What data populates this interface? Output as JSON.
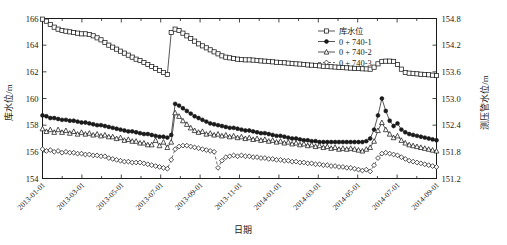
{
  "chart_data": {
    "type": "line",
    "title": "",
    "xlabel": "日期",
    "ylabel": "库水位/m",
    "ylabel_right": "测压管水位/m",
    "grid": false,
    "legend_position": "top-right",
    "ylim": [
      154,
      166
    ],
    "ylim_right": [
      151.2,
      154.8
    ],
    "yticks": [
      "154",
      "156",
      "158",
      "160",
      "162",
      "164",
      "166"
    ],
    "ytick_values": [
      154,
      156,
      158,
      160,
      162,
      164,
      166
    ],
    "yticks_right": [
      "151.2",
      "151.8",
      "152.4",
      "153.0",
      "153.6",
      "154.2",
      "154.8"
    ],
    "ytick_values_right": [
      151.2,
      151.8,
      152.4,
      153.0,
      153.6,
      154.2,
      154.8
    ],
    "xlim": [
      "2013-01-01",
      "2014-09-01"
    ],
    "xticks": [
      "2013-01-01",
      "2013-03-01",
      "2013-05-01",
      "2013-07-01",
      "2013-09-01",
      "2013-11-01",
      "2014-01-01",
      "2014-03-01",
      "2014-05-01",
      "2014-07-01",
      "2014-09-01"
    ],
    "x": [
      0,
      1,
      2,
      3,
      4,
      5,
      6,
      7,
      8,
      9,
      10,
      11,
      12,
      13,
      14,
      15,
      16,
      17,
      18,
      19,
      20,
      21,
      22,
      23,
      24,
      25,
      26,
      27,
      28,
      29,
      30,
      31,
      32,
      33,
      34,
      35,
      36,
      37,
      38,
      39,
      40,
      41,
      42,
      43,
      44,
      45,
      46,
      47,
      48,
      49,
      50,
      51,
      52,
      53,
      54,
      55,
      56,
      57,
      58,
      59,
      60,
      61,
      62,
      63,
      64,
      65,
      66,
      67,
      68,
      69,
      70,
      71,
      72,
      73,
      74,
      75,
      76,
      77,
      78,
      79,
      80,
      81,
      82,
      83,
      84,
      85,
      86,
      87,
      88,
      89,
      90,
      91,
      92,
      93,
      94,
      95,
      96,
      97,
      98,
      99,
      100,
      101
    ],
    "series": [
      {
        "name": "库水位",
        "axis": "left",
        "marker": "open-square",
        "linestyle": "solid",
        "values": [
          165.95,
          165.8,
          165.55,
          165.35,
          165.2,
          165.1,
          165.05,
          165.0,
          164.95,
          164.9,
          164.85,
          164.85,
          164.8,
          164.7,
          164.55,
          164.4,
          164.2,
          164.0,
          163.85,
          163.7,
          163.55,
          163.4,
          163.25,
          163.1,
          162.95,
          162.85,
          162.7,
          162.55,
          162.4,
          162.25,
          162.1,
          161.95,
          161.8,
          164.95,
          165.2,
          165.1,
          164.9,
          164.7,
          164.5,
          164.3,
          164.1,
          163.95,
          163.8,
          163.65,
          163.5,
          163.35,
          163.2,
          163.1,
          163.05,
          163.0,
          162.95,
          162.92,
          162.9,
          162.9,
          162.88,
          162.85,
          162.82,
          162.8,
          162.78,
          162.75,
          162.72,
          162.7,
          162.68,
          162.65,
          162.62,
          162.6,
          162.58,
          162.55,
          162.52,
          162.5,
          162.48,
          162.45,
          162.42,
          162.4,
          162.38,
          162.36,
          162.34,
          162.32,
          162.3,
          162.28,
          162.26,
          162.25,
          162.23,
          162.22,
          162.2,
          162.35,
          162.6,
          162.78,
          162.8,
          162.8,
          162.78,
          162.55,
          162.2,
          161.95,
          161.9,
          161.88,
          161.85,
          161.82,
          161.8,
          161.78,
          161.75,
          161.72
        ],
        "values_note": "Reservoir water level in meters on left axis"
      },
      {
        "name": "0 + 740-1",
        "axis": "right",
        "marker": "filled-circle",
        "linestyle": "solid",
        "values": [
          152.62,
          152.6,
          152.56,
          152.56,
          152.54,
          152.52,
          152.52,
          152.5,
          152.5,
          152.48,
          152.46,
          152.46,
          152.44,
          152.42,
          152.4,
          152.4,
          152.38,
          152.36,
          152.34,
          152.32,
          152.3,
          152.28,
          152.26,
          152.26,
          152.24,
          152.22,
          152.2,
          152.2,
          152.18,
          152.16,
          152.14,
          152.14,
          152.12,
          152.18,
          152.88,
          152.84,
          152.78,
          152.72,
          152.66,
          152.6,
          152.56,
          152.52,
          152.48,
          152.44,
          152.42,
          152.4,
          152.38,
          152.36,
          152.34,
          152.34,
          152.32,
          152.3,
          152.28,
          152.28,
          152.26,
          152.24,
          152.22,
          152.22,
          152.2,
          152.18,
          152.16,
          152.16,
          152.14,
          152.12,
          152.1,
          152.1,
          152.08,
          152.06,
          152.06,
          152.04,
          152.04,
          152.02,
          152.02,
          152.02,
          152.02,
          152.02,
          152.02,
          152.02,
          152.02,
          152.02,
          152.02,
          152.02,
          152.02,
          152.04,
          152.1,
          152.3,
          152.62,
          153.0,
          152.72,
          152.5,
          152.38,
          152.44,
          152.3,
          152.24,
          152.2,
          152.18,
          152.16,
          152.14,
          152.12,
          152.1,
          152.08,
          152.06
        ],
        "values_note": "Piezometer 0+740-1 water level on right axis"
      },
      {
        "name": "0 + 740-2",
        "axis": "right",
        "marker": "open-triangle",
        "linestyle": "solid",
        "values": [
          152.32,
          152.26,
          152.3,
          152.24,
          152.3,
          152.24,
          152.28,
          152.22,
          152.26,
          152.2,
          152.24,
          152.2,
          152.22,
          152.18,
          152.2,
          152.16,
          152.18,
          152.14,
          152.14,
          152.1,
          152.12,
          152.06,
          152.08,
          152.04,
          152.04,
          152.0,
          152.0,
          151.96,
          151.96,
          152.06,
          151.94,
          152.02,
          151.9,
          152.02,
          152.68,
          152.6,
          152.5,
          152.42,
          152.34,
          152.28,
          152.24,
          152.26,
          152.2,
          152.22,
          152.18,
          152.2,
          152.16,
          152.18,
          152.14,
          152.16,
          152.12,
          152.14,
          152.1,
          152.12,
          152.08,
          152.1,
          152.06,
          152.08,
          152.04,
          152.06,
          152.02,
          152.04,
          152.0,
          152.02,
          151.98,
          152.0,
          151.96,
          151.98,
          151.94,
          151.96,
          151.92,
          151.94,
          151.9,
          151.92,
          151.88,
          151.9,
          151.86,
          151.88,
          151.86,
          151.88,
          151.86,
          151.84,
          151.82,
          151.86,
          151.9,
          152.04,
          152.28,
          152.46,
          152.3,
          152.2,
          152.12,
          152.16,
          152.06,
          152.0,
          151.96,
          151.94,
          151.92,
          151.9,
          151.88,
          151.86,
          151.84,
          151.82
        ],
        "values_note": "Piezometer 0+740-2 water level on right axis"
      },
      {
        "name": "0 + 740-3",
        "axis": "right",
        "marker": "open-diamond",
        "linestyle": "dashed",
        "values": [
          151.86,
          151.82,
          151.84,
          151.8,
          151.82,
          151.78,
          151.8,
          151.78,
          151.78,
          151.76,
          151.76,
          151.74,
          151.74,
          151.72,
          151.72,
          151.7,
          151.7,
          151.66,
          151.64,
          151.62,
          151.6,
          151.58,
          151.58,
          151.56,
          151.56,
          151.56,
          151.54,
          151.52,
          151.5,
          151.48,
          151.46,
          151.44,
          151.42,
          151.62,
          151.86,
          151.92,
          151.94,
          151.94,
          151.92,
          151.9,
          151.88,
          151.86,
          151.84,
          151.82,
          151.8,
          151.44,
          151.6,
          151.68,
          151.7,
          151.72,
          151.7,
          151.72,
          151.7,
          151.7,
          151.68,
          151.68,
          151.66,
          151.66,
          151.64,
          151.64,
          151.62,
          151.62,
          151.6,
          151.6,
          151.58,
          151.58,
          151.56,
          151.56,
          151.54,
          151.54,
          151.52,
          151.52,
          151.5,
          151.5,
          151.48,
          151.48,
          151.46,
          151.46,
          151.44,
          151.44,
          151.42,
          151.4,
          151.38,
          151.4,
          151.36,
          151.5,
          151.66,
          151.76,
          151.78,
          151.76,
          151.74,
          151.72,
          151.68,
          151.64,
          151.6,
          151.58,
          151.56,
          151.54,
          151.52,
          151.5,
          151.48,
          151.46
        ],
        "values_note": "Piezometer 0+740-3 water level on right axis"
      }
    ]
  }
}
